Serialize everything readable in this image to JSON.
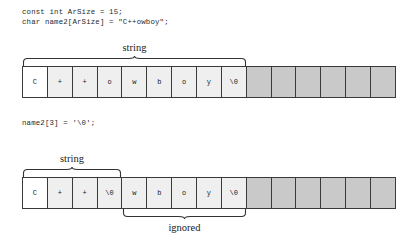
{
  "figure": {
    "code_blocks": [
      {
        "id": "code-1",
        "text": "const int ArSize = 15;\nchar name2[ArSize] = \"C++owboy\";"
      },
      {
        "id": "code-2",
        "text": "name2[3] = '\\0';"
      }
    ],
    "arrays": [
      {
        "id": "array-1",
        "size": 15,
        "cells": [
          {
            "value": "C",
            "state": "first"
          },
          {
            "value": "+",
            "state": "filled"
          },
          {
            "value": "+",
            "state": "filled"
          },
          {
            "value": "o",
            "state": "filled"
          },
          {
            "value": "w",
            "state": "filled"
          },
          {
            "value": "b",
            "state": "filled"
          },
          {
            "value": "o",
            "state": "filled"
          },
          {
            "value": "y",
            "state": "filled"
          },
          {
            "value": "\\0",
            "state": "filled"
          },
          {
            "value": "",
            "state": "empty"
          },
          {
            "value": "",
            "state": "empty"
          },
          {
            "value": "",
            "state": "empty"
          },
          {
            "value": "",
            "state": "empty"
          },
          {
            "value": "",
            "state": "empty"
          },
          {
            "value": "",
            "state": "empty"
          }
        ]
      },
      {
        "id": "array-2",
        "size": 15,
        "cells": [
          {
            "value": "C",
            "state": "first"
          },
          {
            "value": "+",
            "state": "filled"
          },
          {
            "value": "+",
            "state": "filled"
          },
          {
            "value": "\\0",
            "state": "filled"
          },
          {
            "value": "w",
            "state": "filled"
          },
          {
            "value": "b",
            "state": "filled"
          },
          {
            "value": "o",
            "state": "filled"
          },
          {
            "value": "y",
            "state": "filled"
          },
          {
            "value": "\\0",
            "state": "filled"
          },
          {
            "value": "",
            "state": "empty"
          },
          {
            "value": "",
            "state": "empty"
          },
          {
            "value": "",
            "state": "empty"
          },
          {
            "value": "",
            "state": "empty"
          },
          {
            "value": "",
            "state": "empty"
          },
          {
            "value": "",
            "state": "empty"
          }
        ]
      }
    ],
    "annotations": [
      {
        "id": "brace-string-1",
        "label": "string",
        "spans_cells": "1-9",
        "position": "above"
      },
      {
        "id": "brace-string-2",
        "label": "string",
        "spans_cells": "1-4",
        "position": "above"
      },
      {
        "id": "brace-ignored",
        "label": "ignored",
        "spans_cells": "5-9",
        "position": "below"
      }
    ],
    "colors": {
      "cell_border": "#3a3a3a",
      "cell_filled": "#efefef",
      "cell_first": "#ffffff",
      "cell_empty": "#c9c9c9",
      "text": "#1a1a1a",
      "background": "#ffffff"
    }
  }
}
